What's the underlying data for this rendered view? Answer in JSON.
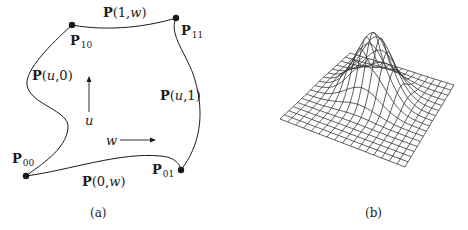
{
  "panel_a": {
    "caption": "(a)",
    "corners": [
      {
        "id": "P00",
        "bold": "P",
        "sub": "00",
        "x": 26,
        "y": 176
      },
      {
        "id": "P01",
        "bold": "P",
        "sub": "01",
        "x": 181,
        "y": 170
      },
      {
        "id": "P10",
        "bold": "P",
        "sub": "10",
        "x": 72,
        "y": 25
      },
      {
        "id": "P11",
        "bold": "P",
        "sub": "11",
        "x": 176,
        "y": 18
      }
    ],
    "edges": {
      "top": {
        "bold": "P",
        "args": "(1,",
        "var": "w",
        "close": ")"
      },
      "left": {
        "bold": "P",
        "open": "(",
        "var": "u",
        "args": ",0)"
      },
      "right": {
        "bold": "P",
        "open": "(",
        "var": "u",
        "args": ",1)"
      },
      "bottom": {
        "bold": "P",
        "args": "(0,",
        "var": "w",
        "close": ")"
      }
    },
    "axis_u": "u",
    "axis_w": "w"
  },
  "panel_b": {
    "caption": "(b)",
    "mesh": {
      "rows": 16,
      "cols": 16,
      "peak_height": 62
    }
  },
  "colors": {
    "ink": "#1a1a1a",
    "mesh": "#333333"
  }
}
